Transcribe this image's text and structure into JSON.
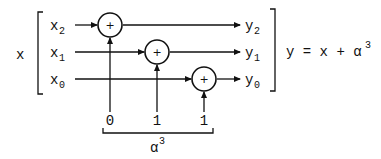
{
  "diagram": {
    "input_label": "x",
    "inputs": [
      {
        "base": "x",
        "sub": "2"
      },
      {
        "base": "x",
        "sub": "1"
      },
      {
        "base": "x",
        "sub": "0"
      }
    ],
    "outputs": [
      {
        "base": "y",
        "sub": "2"
      },
      {
        "base": "y",
        "sub": "1"
      },
      {
        "base": "y",
        "sub": "0"
      }
    ],
    "adder_symbol": "+",
    "constant_bits": [
      "0",
      "1",
      "1"
    ],
    "constant_label": {
      "base": "α",
      "sup": "3"
    },
    "equation": {
      "text": "y = x + α",
      "sup": "3"
    }
  }
}
